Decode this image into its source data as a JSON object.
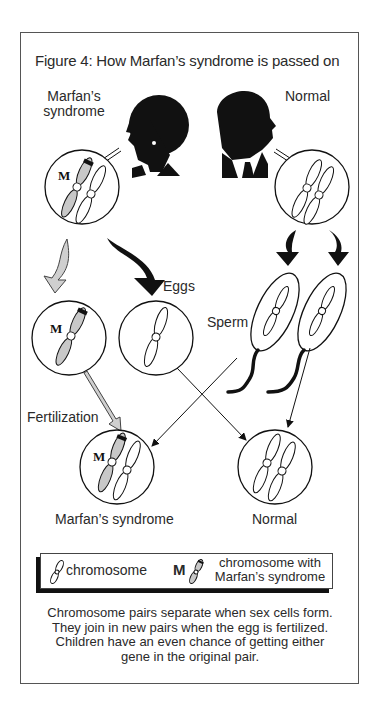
{
  "figure": {
    "title": "Figure 4:  How Marfan’s syndrome is passed on",
    "parents": {
      "affected_label": "Marfan’s\nsyndrome",
      "affected_label_line1": "Marfan’s",
      "affected_label_line2": "syndrome",
      "normal_label": "Normal"
    },
    "gametes": {
      "eggs_label": "Eggs",
      "sperm_label": "Sperm"
    },
    "process_label": "Fertilization",
    "marker_letter": "M",
    "offspring": [
      {
        "label": "Marfan’s syndrome"
      },
      {
        "label": "Normal"
      }
    ],
    "legend": {
      "normal_item": "chromosome",
      "marfan_marker": "M",
      "marfan_item_line1": "chromosome with",
      "marfan_item_line2": "Marfan’s syndrome"
    },
    "caption": "Chromosome pairs separate when sex cells form.  They join in new pairs when the egg is fertilized.  Children have an even chance of getting either gene in the original pair.",
    "colors": {
      "ink": "#111111",
      "affected_fill": "#c8c8c8",
      "frame": "#555555"
    }
  }
}
